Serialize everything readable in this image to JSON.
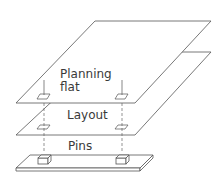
{
  "diagram": {
    "type": "layered-exploded-view",
    "layers": [
      {
        "label_line1": "Planning",
        "label_line2": "flat"
      },
      {
        "label": "Layout"
      },
      {
        "label": "Pins"
      }
    ],
    "stroke_color": "#555555"
  }
}
